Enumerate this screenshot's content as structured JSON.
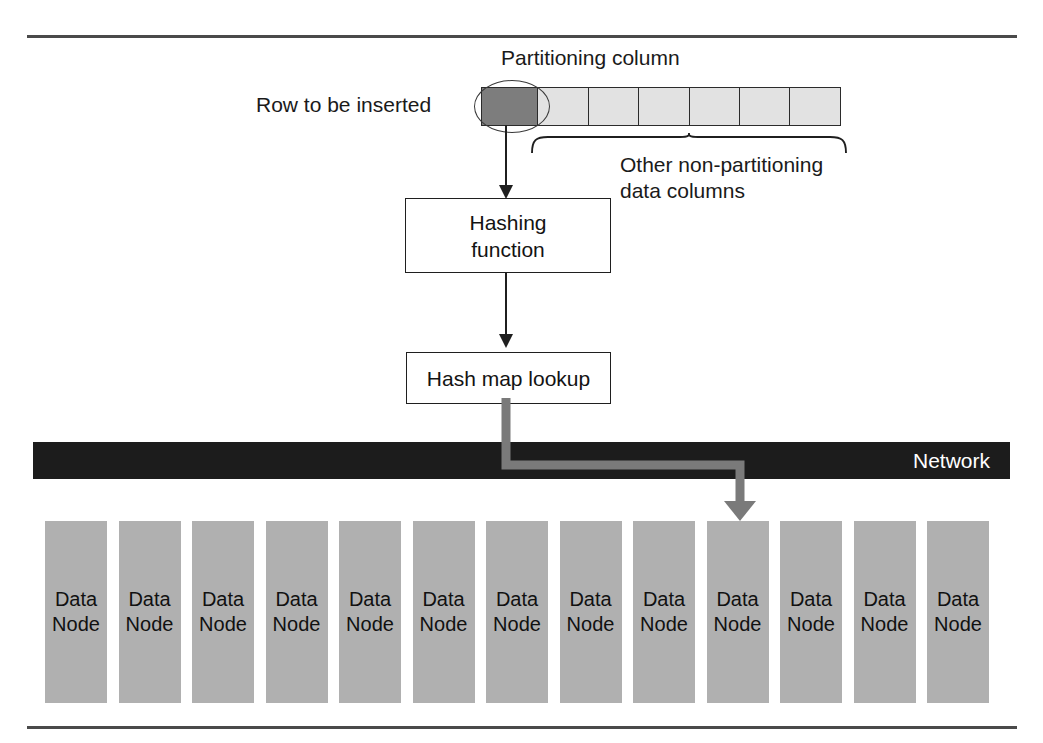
{
  "diagram": {
    "title_visible": false,
    "labels": {
      "partitioning_column": "Partitioning column",
      "row_to_be_inserted": "Row to be inserted",
      "other_columns_line1": "Other non-partitioning",
      "other_columns_line2": "data columns"
    },
    "row": {
      "partition_cell_count": 1,
      "data_cell_count": 6,
      "partition_cell_color": "#7d7d7d",
      "data_cell_color": "#e2e2e2",
      "border_color": "#2b2b2b"
    },
    "boxes": {
      "hashing": {
        "line1": "Hashing",
        "line2": "function"
      },
      "lookup": {
        "line1": "Hash map lookup"
      }
    },
    "network": {
      "label": "Network",
      "bar_color": "#1c1c1c",
      "label_color": "#ffffff"
    },
    "route": {
      "color": "#7a7a7a",
      "target_node_index": 10
    },
    "nodes": {
      "count": 13,
      "label_line1": "Data",
      "label_line2": "Node",
      "fill_color": "#b0b0b0",
      "items": [
        {
          "line1": "Data",
          "line2": "Node"
        },
        {
          "line1": "Data",
          "line2": "Node"
        },
        {
          "line1": "Data",
          "line2": "Node"
        },
        {
          "line1": "Data",
          "line2": "Node"
        },
        {
          "line1": "Data",
          "line2": "Node"
        },
        {
          "line1": "Data",
          "line2": "Node"
        },
        {
          "line1": "Data",
          "line2": "Node"
        },
        {
          "line1": "Data",
          "line2": "Node"
        },
        {
          "line1": "Data",
          "line2": "Node"
        },
        {
          "line1": "Data",
          "line2": "Node"
        },
        {
          "line1": "Data",
          "line2": "Node"
        },
        {
          "line1": "Data",
          "line2": "Node"
        },
        {
          "line1": "Data",
          "line2": "Node"
        }
      ]
    }
  }
}
